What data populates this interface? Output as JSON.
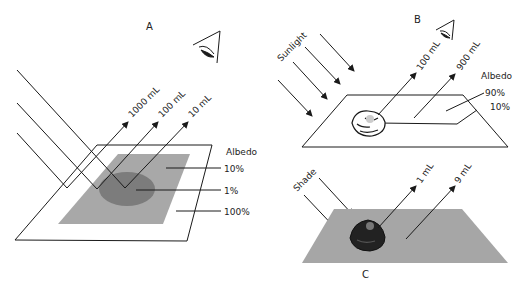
{
  "panels": {
    "a": {
      "label": "A",
      "reflections": [
        "1000 mL",
        "100 mL",
        "10 mL"
      ],
      "legend_title": "Albedo",
      "albedo_values": [
        "10%",
        "1%",
        "100%"
      ]
    },
    "b": {
      "label": "B",
      "incoming_label": "Sunlight",
      "reflections": [
        "100 mL",
        "900 mL"
      ],
      "legend_title": "Albedo",
      "albedo_values": [
        "90%",
        "10%"
      ]
    },
    "c": {
      "label": "C",
      "incoming_label": "Shade",
      "reflections": [
        "1 mL",
        "9 mL"
      ]
    }
  },
  "colors": {
    "line": "#1a1a1a",
    "gray_surface": "#a8a8a8",
    "dark_ellipse": "#7c7c7c",
    "shade_surface": "#a6a6a6"
  }
}
